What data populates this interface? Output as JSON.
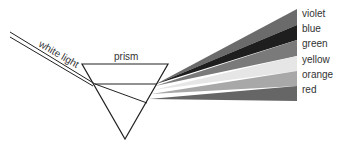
{
  "diagram": {
    "incoming_label": "white light",
    "prism_label": "prism",
    "bands": [
      {
        "name": "violet",
        "color": "#6b6b6b"
      },
      {
        "name": "blue",
        "color": "#1e1e1e"
      },
      {
        "name": "green",
        "color": "#7a7a7a"
      },
      {
        "name": "yellow",
        "color": "#e6e6e6"
      },
      {
        "name": "orange",
        "color": "#a8a8a8"
      },
      {
        "name": "red",
        "color": "#666666"
      }
    ]
  }
}
